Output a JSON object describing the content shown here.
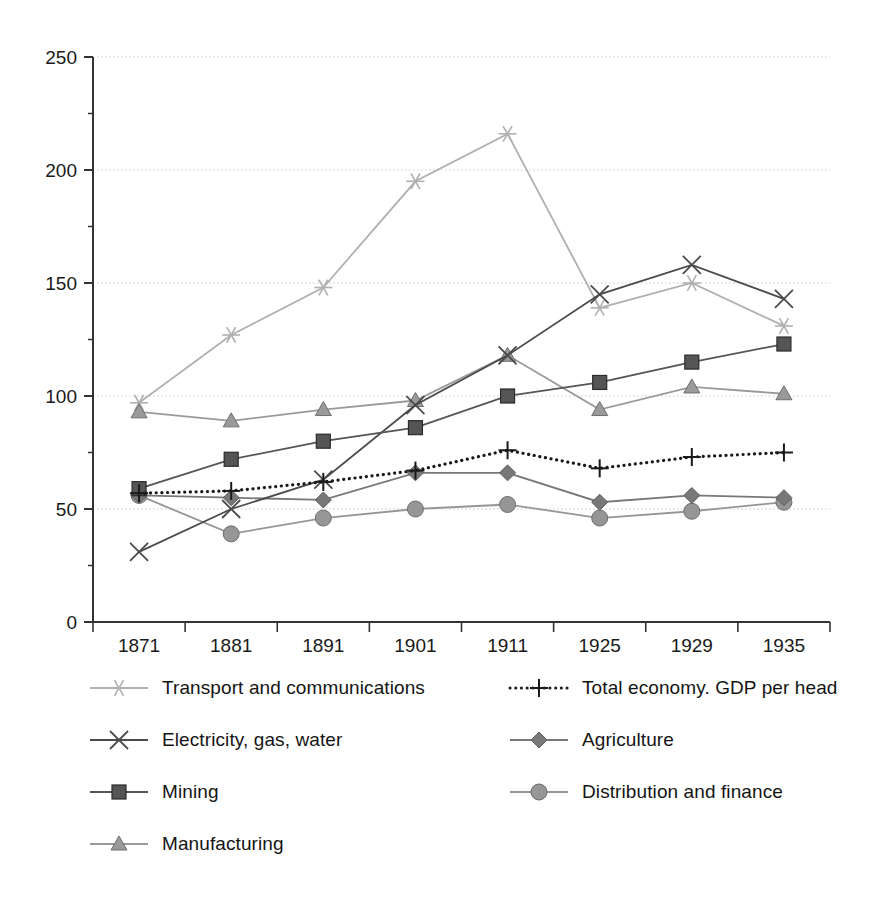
{
  "chart_data": {
    "type": "line",
    "title": "",
    "subtitle": "",
    "xlabel": "",
    "ylabel": "",
    "x": [
      "1871",
      "1881",
      "1891",
      "1901",
      "1911",
      "1925",
      "1929",
      "1935"
    ],
    "categories": [
      "1871",
      "1881",
      "1891",
      "1901",
      "1911",
      "1925",
      "1929",
      "1935"
    ],
    "ylim": [
      0,
      250
    ],
    "ytick_labels": [
      "0",
      "50",
      "100",
      "150",
      "200",
      "250"
    ],
    "yticks": [
      0,
      50,
      100,
      150,
      200,
      250
    ],
    "grid": "horizontal-dotted",
    "legend_position": "bottom-two-columns",
    "series": [
      {
        "name": "Transport and communications",
        "marker": "asterisk",
        "color": "#b0b0b0",
        "linestyle": "solid",
        "values": [
          97,
          127,
          148,
          195,
          216,
          139,
          150,
          131
        ]
      },
      {
        "name": "Electricity, gas, water",
        "marker": "x",
        "color": "#4a4a4a",
        "linestyle": "solid",
        "values": [
          31,
          50,
          63,
          96,
          118,
          145,
          158,
          143
        ]
      },
      {
        "name": "Mining",
        "marker": "square",
        "color": "#555555",
        "linestyle": "solid",
        "values": [
          59,
          72,
          80,
          86,
          100,
          106,
          115,
          123
        ]
      },
      {
        "name": "Manufacturing",
        "marker": "triangle",
        "color": "#9a9a9a",
        "linestyle": "solid",
        "values": [
          93,
          89,
          94,
          98,
          118,
          94,
          104,
          101
        ]
      },
      {
        "name": "Total economy. GDP per head",
        "marker": "plus",
        "color": "#1a1a1a",
        "linestyle": "dotted",
        "values": [
          57,
          58,
          62,
          67,
          76,
          68,
          73,
          75
        ]
      },
      {
        "name": "Agriculture",
        "marker": "diamond",
        "color": "#787878",
        "linestyle": "solid",
        "values": [
          56,
          55,
          54,
          66,
          66,
          53,
          56,
          55
        ]
      },
      {
        "name": "Distribution and finance",
        "marker": "circle",
        "color": "#969696",
        "linestyle": "solid",
        "values": [
          56,
          39,
          46,
          50,
          52,
          46,
          49,
          53
        ]
      }
    ]
  },
  "legend": {
    "left_column": [
      {
        "label": "Transport and communications",
        "series_index": 0
      },
      {
        "label": "Electricity, gas, water",
        "series_index": 1
      },
      {
        "label": "Mining",
        "series_index": 2
      },
      {
        "label": "Manufacturing",
        "series_index": 3
      }
    ],
    "right_column": [
      {
        "label": "Total economy. GDP per head",
        "series_index": 4
      },
      {
        "label": "Agriculture",
        "series_index": 5
      },
      {
        "label": "Distribution and finance",
        "series_index": 6
      }
    ]
  },
  "axes": {
    "x_tick_labels": [
      "1871",
      "1881",
      "1891",
      "1901",
      "1911",
      "1925",
      "1929",
      "1935"
    ],
    "y_tick_labels": [
      "250",
      "200",
      "150",
      "100",
      "50",
      "0"
    ]
  },
  "colors": {
    "axis": "#333333",
    "grid": "#c8c8c8",
    "background": "#ffffff",
    "text": "#1a1a1a"
  }
}
